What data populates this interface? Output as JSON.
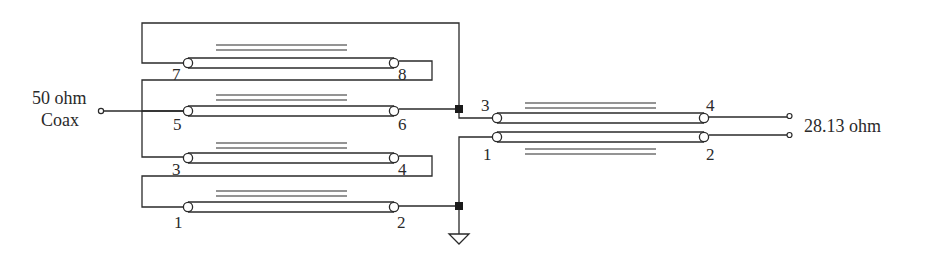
{
  "diagram": {
    "type": "transmission-line transformer schematic",
    "input": {
      "label_line1": "50 ohm",
      "label_line2": "Coax"
    },
    "output": {
      "label": "28.13 ohm"
    },
    "left_bank": {
      "lines": [
        {
          "name": "line-7-8",
          "start_pin": "7",
          "end_pin": "8"
        },
        {
          "name": "line-5-6",
          "start_pin": "5",
          "end_pin": "6"
        },
        {
          "name": "line-3-4",
          "start_pin": "3",
          "end_pin": "4"
        },
        {
          "name": "line-1-2",
          "start_pin": "1",
          "end_pin": "2"
        }
      ]
    },
    "right_transformer": {
      "top_line": {
        "start_pin": "3",
        "end_pin": "4"
      },
      "bottom_line": {
        "start_pin": "1",
        "end_pin": "2"
      }
    },
    "symbols": {
      "ground": "ground-icon",
      "junction": "junction-dot",
      "terminal": "open-terminal-circle"
    },
    "colors": {
      "stroke": "#2a2a2a",
      "background": "#ffffff"
    }
  }
}
